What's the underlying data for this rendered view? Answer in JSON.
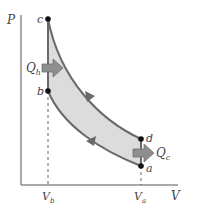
{
  "diagram": {
    "type": "PV diagram (Otto cycle)",
    "axes": {
      "y_label": "P",
      "x_label": "V"
    },
    "volume_ticks": {
      "vb": "V",
      "vb_sub": "b",
      "va": "V",
      "va_sub": "a"
    },
    "points": {
      "a": "a",
      "b": "b",
      "c": "c",
      "d": "d"
    },
    "heat": {
      "qh": "Q",
      "qh_sub": "h",
      "qc": "Q",
      "qc_sub": "c"
    },
    "colors": {
      "fill": "#dcdcdc",
      "stroke": "#6a6a6a",
      "arrow": "#8e8e8e",
      "axis": "#555555",
      "point": "#111111"
    }
  }
}
